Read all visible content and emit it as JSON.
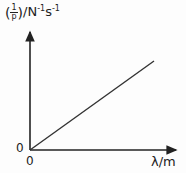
{
  "y_axis": {
    "label_prefix_num": "1",
    "label_prefix_den": "p",
    "label_unit": "/N",
    "label_unit_exp1": "-1",
    "label_unit_s": "s",
    "label_unit_exp2": "-1"
  },
  "x_axis": {
    "label": "λ/m"
  },
  "origin": {
    "y_zero": "0",
    "x_zero": "0"
  },
  "line": {
    "description": "straight line through origin, positive slope"
  },
  "colors": {
    "axis": "#222222",
    "line": "#333333"
  }
}
